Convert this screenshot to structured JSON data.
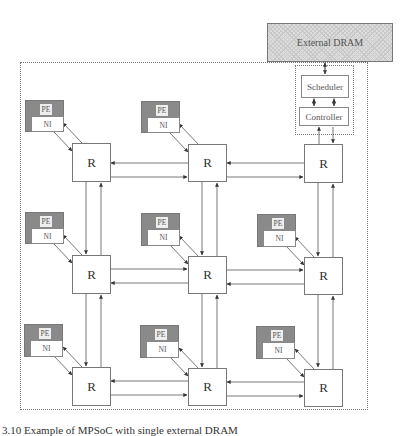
{
  "diagram": {
    "external_memory": {
      "label": "External DRAM"
    },
    "memory_controller": {
      "scheduler_label": "Scheduler",
      "controller_label": "Controller"
    },
    "mesh": {
      "rows": 3,
      "cols": 3,
      "router_label": "R",
      "pe_label": "PE",
      "ni_label": "NI",
      "routers": [
        {
          "row": 0,
          "col": 0,
          "label": "R",
          "has_pe": true
        },
        {
          "row": 0,
          "col": 1,
          "label": "R",
          "has_pe": true
        },
        {
          "row": 0,
          "col": 2,
          "label": "R",
          "has_pe": false,
          "attached": "Controller"
        },
        {
          "row": 1,
          "col": 0,
          "label": "R",
          "has_pe": true
        },
        {
          "row": 1,
          "col": 1,
          "label": "R",
          "has_pe": true
        },
        {
          "row": 1,
          "col": 2,
          "label": "R",
          "has_pe": true
        },
        {
          "row": 2,
          "col": 0,
          "label": "R",
          "has_pe": true
        },
        {
          "row": 2,
          "col": 1,
          "label": "R",
          "has_pe": true
        },
        {
          "row": 2,
          "col": 2,
          "label": "R",
          "has_pe": true
        }
      ]
    },
    "caption": "3.10 Example of MPSoC with single external DRAM"
  },
  "colors": {
    "pe_fill": "#8a8a8a",
    "dram_fill": "#dddddd",
    "line": "#555555"
  }
}
